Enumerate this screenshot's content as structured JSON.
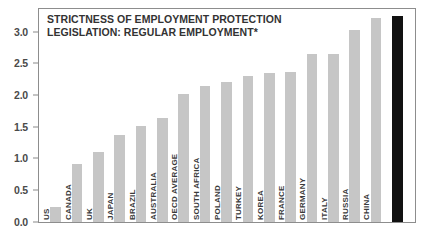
{
  "chart_data": {
    "type": "bar",
    "title_lines": [
      "STRICTNESS OF EMPLOYMENT PROTECTION",
      "LEGISLATION: REGULAR EMPLOYMENT*"
    ],
    "xlabel": "",
    "ylabel": "",
    "ylim": [
      0.0,
      3.35
    ],
    "grid": false,
    "legend": null,
    "categories": [
      "US",
      "CANADA",
      "UK",
      "JAPAN",
      "BRAZIL",
      "AUSTRALIA",
      "OECD AVERAGE",
      "SOUTH AFRICA",
      "POLAND",
      "TURKEY",
      "KOREA",
      "FRANCE",
      "GERMANY",
      "ITALY",
      "RUSSIA",
      "CHINA",
      "INDIA"
    ],
    "values": [
      0.23,
      0.92,
      1.1,
      1.37,
      1.52,
      1.65,
      2.03,
      2.15,
      2.22,
      2.3,
      2.36,
      2.37,
      2.66,
      2.66,
      3.04,
      3.23,
      3.25
    ],
    "ytick_labels": [
      "3.0",
      "2.5",
      "2.0",
      "1.5",
      "1.0",
      "0.5",
      "0.0"
    ],
    "ytick_values": [
      3.0,
      2.5,
      2.0,
      1.5,
      1.0,
      0.5,
      0.0
    ],
    "bars": [
      {
        "label": "US",
        "value": 0.23,
        "highlight": false
      },
      {
        "label": "CANADA",
        "value": 0.92,
        "highlight": false
      },
      {
        "label": "UK",
        "value": 1.1,
        "highlight": false
      },
      {
        "label": "JAPAN",
        "value": 1.37,
        "highlight": false
      },
      {
        "label": "BRAZIL",
        "value": 1.52,
        "highlight": false
      },
      {
        "label": "AUSTRALIA",
        "value": 1.65,
        "highlight": false
      },
      {
        "label": "OECD AVERAGE",
        "value": 2.03,
        "highlight": false
      },
      {
        "label": "SOUTH AFRICA",
        "value": 2.15,
        "highlight": false
      },
      {
        "label": "POLAND",
        "value": 2.22,
        "highlight": false
      },
      {
        "label": "TURKEY",
        "value": 2.3,
        "highlight": false
      },
      {
        "label": "KOREA",
        "value": 2.36,
        "highlight": false
      },
      {
        "label": "FRANCE",
        "value": 2.37,
        "highlight": false
      },
      {
        "label": "GERMANY",
        "value": 2.66,
        "highlight": false
      },
      {
        "label": "ITALY",
        "value": 2.66,
        "highlight": false
      },
      {
        "label": "RUSSIA",
        "value": 3.04,
        "highlight": false
      },
      {
        "label": "CHINA",
        "value": 3.23,
        "highlight": false
      },
      {
        "label": "INDIA",
        "value": 3.25,
        "highlight": true
      }
    ],
    "colors": {
      "bar": "#c6c6c6",
      "bar_highlight": "#111111",
      "frame": "#8d8d8d",
      "text": "#333333",
      "background": "#ffffff"
    }
  }
}
